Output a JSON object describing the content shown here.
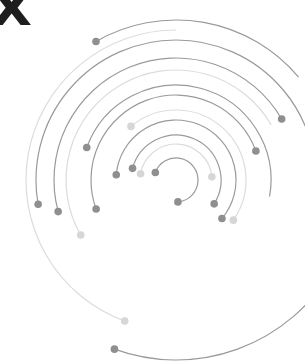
{
  "graphic": {
    "title_glyph": "X",
    "description": "Concentric circular arcs with node dots (network / orbit illustration)",
    "colors": {
      "background": "#ffffff",
      "glyph": "#1e1e1e",
      "arc_dark": "#9a9a9a",
      "arc_light": "#dcdcdc",
      "dot_dark": "#8f8f8f",
      "dot_light": "#d6d6d6"
    },
    "ring_count": 11,
    "dot_count": 26
  }
}
